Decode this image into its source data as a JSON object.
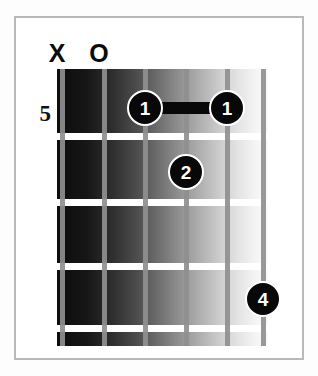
{
  "diagram": {
    "type": "guitar-chord-diagram",
    "base_fret_label": "5",
    "string_count": 6,
    "fret_count": 5,
    "colors": {
      "frame_border": "#b9b9b9",
      "card_background": "#ffffff",
      "fret_line": "#ffffff",
      "string_line": "#8f8f8f",
      "dot_fill": "#080808",
      "dot_text": "#ffffff",
      "board_dark": "#0d0d0d",
      "board_light": "#fafafa"
    }
  },
  "board_geometry": {
    "left": 57,
    "top": 69,
    "width": 211,
    "height": 277,
    "string_x": [
      62,
      104,
      145,
      186,
      227,
      263
    ],
    "fret_y": [
      69,
      136,
      202,
      266,
      328,
      346
    ]
  },
  "open_mute_markers": [
    {
      "string": 1,
      "symbol": "X",
      "name": "muted",
      "x": 57,
      "y": 41
    },
    {
      "string": 2,
      "symbol": "O",
      "name": "open",
      "x": 99,
      "y": 41
    }
  ],
  "base_fret": {
    "label": "5",
    "x": 51,
    "y": 113
  },
  "barres": [
    {
      "finger": "1",
      "fret": 5,
      "from_string": 3,
      "to_string": 5,
      "x": 145,
      "y": 108,
      "width": 82,
      "height": 12
    }
  ],
  "finger_dots": [
    {
      "label": "1",
      "string": 3,
      "fret": 5,
      "x": 145,
      "y": 108,
      "size": 36
    },
    {
      "label": "1",
      "string": 5,
      "fret": 5,
      "x": 227,
      "y": 108,
      "size": 36
    },
    {
      "label": "2",
      "string": 4,
      "fret": 6,
      "x": 186,
      "y": 172,
      "size": 36
    },
    {
      "label": "4",
      "string": 6,
      "fret": 9,
      "x": 263,
      "y": 299,
      "size": 36
    }
  ],
  "fret_lines": [
    {
      "index": 0,
      "y": 69,
      "thickness": 3
    },
    {
      "index": 1,
      "y": 136,
      "thickness": 7
    },
    {
      "index": 2,
      "y": 202,
      "thickness": 7
    },
    {
      "index": 3,
      "y": 266,
      "thickness": 7
    },
    {
      "index": 4,
      "y": 328,
      "thickness": 7
    }
  ],
  "string_lines": [
    {
      "string": 1,
      "x": 62,
      "thickness": 5
    },
    {
      "string": 2,
      "x": 104,
      "thickness": 5
    },
    {
      "string": 3,
      "x": 145,
      "thickness": 5
    },
    {
      "string": 4,
      "x": 186,
      "thickness": 5
    },
    {
      "string": 5,
      "x": 227,
      "thickness": 5
    },
    {
      "string": 6,
      "x": 263,
      "thickness": 5
    }
  ]
}
